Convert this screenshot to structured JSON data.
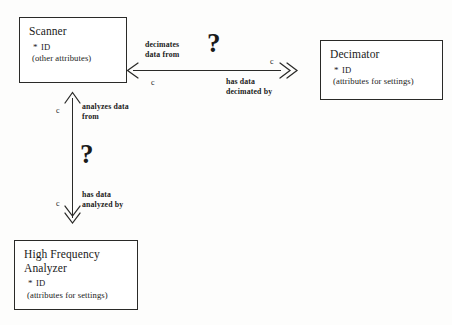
{
  "diagram": {
    "colors": {
      "background": "#fdfdfc",
      "ink": "#2a2a28",
      "box_fill": "#ffffff"
    },
    "entities": [
      {
        "id": "scanner",
        "name": "Scanner",
        "key_bullet": "*",
        "key_attribute": "ID",
        "other_attributes": "(other attributes)"
      },
      {
        "id": "decimator",
        "name": "Decimator",
        "key_bullet": "*",
        "key_attribute": "ID",
        "other_attributes": "(attributes for settings)"
      },
      {
        "id": "high-frequency-analyzer",
        "name": "High Frequency\nAnalyzer",
        "key_bullet": "*",
        "key_attribute": "ID",
        "other_attributes": "(attributes for settings)"
      }
    ],
    "relationships": [
      {
        "id": "scanner-decimator",
        "orientation": "horizontal",
        "from": "Scanner",
        "to": "Decimator",
        "forward_label": "decimates\ndata from",
        "reverse_label": "has data\ndecimated by",
        "cardinality_left": "c",
        "cardinality_right": "c",
        "uncertainty_marker": "?"
      },
      {
        "id": "scanner-hfa",
        "orientation": "vertical",
        "from": "High Frequency Analyzer",
        "to": "Scanner",
        "forward_label": "analyzes data\nfrom",
        "reverse_label": "has data\nanalyzed by",
        "cardinality_top": "c",
        "cardinality_bottom": "c",
        "uncertainty_marker": "?"
      }
    ]
  }
}
